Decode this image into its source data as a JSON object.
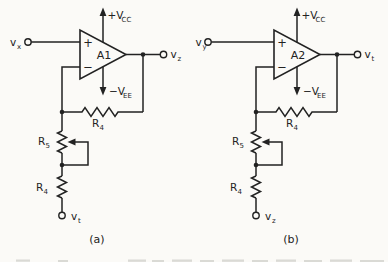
{
  "colors": {
    "paper": "#fbfaf7",
    "ink": "#222222",
    "faded_print": "#b9b9b3"
  },
  "circuits": [
    {
      "caption": "(a)",
      "amp": "A1",
      "noninverting": "+",
      "inverting": "−",
      "input": {
        "base": "v",
        "sub": "x"
      },
      "output": {
        "base": "v",
        "sub": "z"
      },
      "bottom_terminal": {
        "base": "v",
        "sub": "t"
      },
      "supply_pos": {
        "base": "+V",
        "sub": "CC"
      },
      "supply_neg": {
        "base": "−V",
        "sub": "EE"
      },
      "feedback_resistor": {
        "base": "R",
        "sub": "4"
      },
      "potentiometer": {
        "base": "R",
        "sub": "5"
      },
      "lower_resistor": {
        "base": "R",
        "sub": "4"
      }
    },
    {
      "caption": "(b)",
      "amp": "A2",
      "noninverting": "+",
      "inverting": "−",
      "input": {
        "base": "v",
        "sub": "y"
      },
      "output": {
        "base": "v",
        "sub": "t"
      },
      "bottom_terminal": {
        "base": "v",
        "sub": "z"
      },
      "supply_pos": {
        "base": "+V",
        "sub": "CC"
      },
      "supply_neg": {
        "base": "−V",
        "sub": "EE"
      },
      "feedback_resistor": {
        "base": "R",
        "sub": "4"
      },
      "potentiometer": {
        "base": "R",
        "sub": "5"
      },
      "lower_resistor": {
        "base": "R",
        "sub": "4"
      }
    }
  ]
}
